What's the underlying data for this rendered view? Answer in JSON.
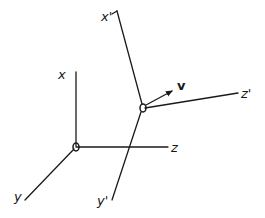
{
  "diagram": {
    "frame_s": {
      "origin_label": "O",
      "axes": [
        {
          "label": "x"
        },
        {
          "label": "y"
        },
        {
          "label": "z"
        }
      ]
    },
    "frame_s_prime": {
      "origin_label": "O'",
      "axes": [
        {
          "label": "x'"
        },
        {
          "label": "y'"
        },
        {
          "label": "z'"
        }
      ],
      "velocity_label": "v"
    },
    "colors": {
      "ink": "#1a1a1a",
      "background": "#ffffff"
    }
  }
}
